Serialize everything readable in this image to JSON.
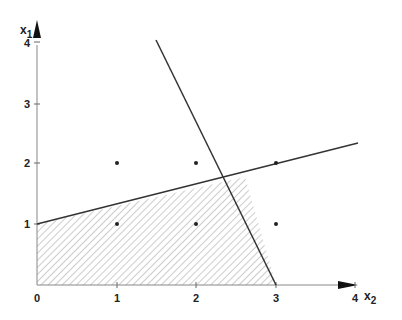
{
  "diagram": {
    "type": "linear-programming-feasible-region",
    "axes": {
      "horizontal": {
        "label": "x",
        "subscript": "2",
        "ticks": [
          "0",
          "1",
          "2",
          "3",
          "4"
        ]
      },
      "vertical": {
        "label": "x",
        "subscript": "1",
        "ticks": [
          "1",
          "2",
          "3",
          "4"
        ]
      }
    },
    "lattice_points": [
      {
        "x2": 1,
        "x1": 2
      },
      {
        "x2": 2,
        "x1": 2
      },
      {
        "x2": 3,
        "x1": 2
      },
      {
        "x2": 1,
        "x1": 1
      },
      {
        "x2": 2,
        "x1": 1
      },
      {
        "x2": 3,
        "x1": 1
      }
    ],
    "constraint_lines": [
      {
        "name": "steep-line",
        "from": {
          "x2": 1.5,
          "x1": 4.0
        },
        "to": {
          "x2": 3.0,
          "x1": 0.0
        }
      },
      {
        "name": "shallow-line",
        "from": {
          "x2": 0.0,
          "x1": 1.0
        },
        "to": {
          "x2": 4.0,
          "x1": 2.33
        }
      }
    ],
    "feasible_region": {
      "fill": "hatched",
      "vertices": [
        {
          "x2": 0,
          "x1": 0
        },
        {
          "x2": 0,
          "x1": 1
        },
        {
          "x2": 2.6,
          "x1": 1.75
        },
        {
          "x2": 3,
          "x1": 0
        }
      ]
    },
    "colors": {
      "line": "#333333",
      "hatch": "#999999",
      "axis": "#888888"
    }
  }
}
